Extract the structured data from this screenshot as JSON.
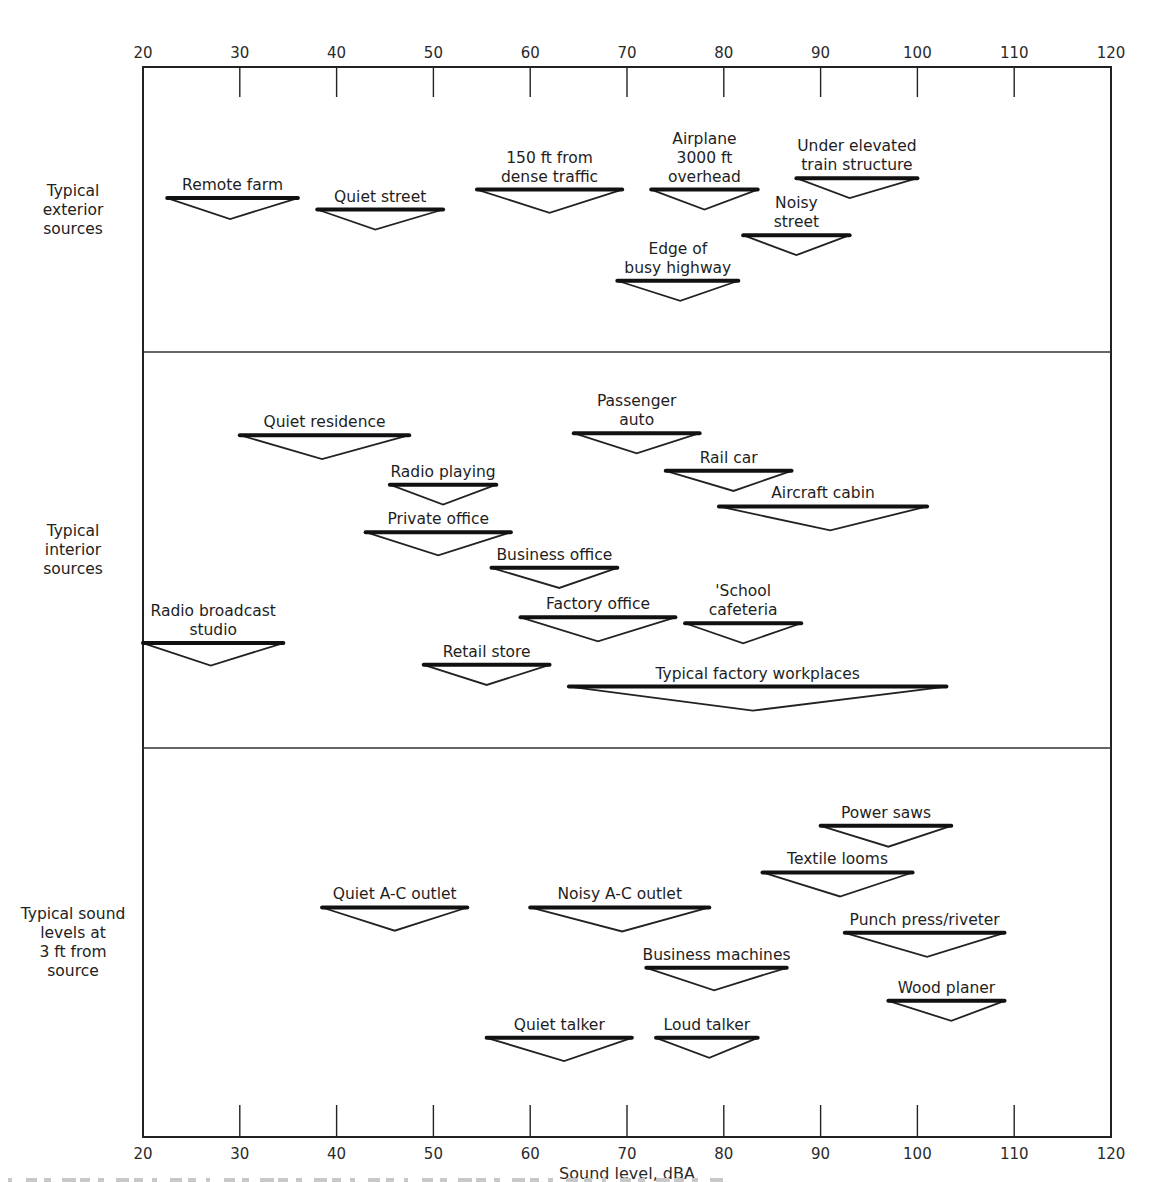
{
  "chart_data": {
    "type": "range-markers",
    "title": "",
    "xlabel": "Sound level, dBA",
    "xlim": [
      20,
      120
    ],
    "xticks": [
      20,
      30,
      40,
      50,
      60,
      70,
      80,
      90,
      100,
      110,
      120
    ],
    "xtick_labels": [
      "20",
      "30",
      "40",
      "50",
      "60",
      "70",
      "80",
      "90",
      "100",
      "110",
      "120"
    ],
    "axis_positions": [
      "top",
      "bottom"
    ],
    "grid": false,
    "marker_description": "Inverted triangle spans low-to-high dBA range; apex marks typical level",
    "panels": [
      {
        "name": "Typical exterior sources",
        "label_lines": [
          "Typical",
          "exterior",
          "sources"
        ],
        "items": [
          {
            "label_lines": [
              "Remote farm"
            ],
            "low": 22.5,
            "high": 36,
            "typical": 29,
            "row": 0.46
          },
          {
            "label_lines": [
              "Quiet  street"
            ],
            "low": 38,
            "high": 51,
            "typical": 44,
            "row": 0.5
          },
          {
            "label_lines": [
              "150 ft from",
              "dense traffic"
            ],
            "low": 54.5,
            "high": 69.5,
            "typical": 62,
            "row": 0.43
          },
          {
            "label_lines": [
              "Airplane",
              "3000 ft",
              "overhead"
            ],
            "low": 72.5,
            "high": 83.5,
            "typical": 78,
            "row": 0.43
          },
          {
            "label_lines": [
              "Under elevated",
              "train structure"
            ],
            "low": 87.5,
            "high": 100,
            "typical": 93,
            "row": 0.39
          },
          {
            "label_lines": [
              "Noisy",
              "street"
            ],
            "low": 82,
            "high": 93,
            "typical": 87.5,
            "row": 0.59
          },
          {
            "label_lines": [
              "Edge of",
              "busy highway"
            ],
            "low": 69,
            "high": 81.5,
            "typical": 75.5,
            "row": 0.75
          }
        ]
      },
      {
        "name": "Typical interior sources",
        "label_lines": [
          "Typical",
          "interior",
          "sources"
        ],
        "items": [
          {
            "label_lines": [
              "Quiet residence"
            ],
            "low": 30,
            "high": 47.5,
            "typical": 38.5,
            "row": 0.21
          },
          {
            "label_lines": [
              "Passenger",
              "auto"
            ],
            "low": 64.5,
            "high": 77.5,
            "typical": 71,
            "row": 0.205
          },
          {
            "label_lines": [
              "Radio playing"
            ],
            "low": 45.5,
            "high": 56.5,
            "typical": 51,
            "row": 0.335
          },
          {
            "label_lines": [
              "Rail car"
            ],
            "low": 74,
            "high": 87,
            "typical": 81,
            "row": 0.3
          },
          {
            "label_lines": [
              "Aircraft cabin"
            ],
            "low": 79.5,
            "high": 101,
            "typical": 91,
            "row": 0.39
          },
          {
            "label_lines": [
              "Private office"
            ],
            "low": 43,
            "high": 58,
            "typical": 50.5,
            "row": 0.455
          },
          {
            "label_lines": [
              "Business office"
            ],
            "low": 56,
            "high": 69,
            "typical": 63,
            "row": 0.545
          },
          {
            "label_lines": [
              "Factory office"
            ],
            "low": 59,
            "high": 75,
            "typical": 67,
            "row": 0.67
          },
          {
            "label_lines": [
              "'School",
              "cafeteria"
            ],
            "low": 76,
            "high": 88,
            "typical": 82,
            "row": 0.685
          },
          {
            "label_lines": [
              "Radio broadcast",
              "studio"
            ],
            "low": 20,
            "high": 34.5,
            "typical": 27,
            "row": 0.735
          },
          {
            "label_lines": [
              "Retail store"
            ],
            "low": 49,
            "high": 62,
            "typical": 55.5,
            "row": 0.79
          },
          {
            "label_lines": [
              "Typical factory workplaces"
            ],
            "low": 64,
            "high": 103,
            "typical": 83,
            "row": 0.845
          }
        ]
      },
      {
        "name": "Typical sound levels at 3 ft from source",
        "label_lines": [
          "Typical sound",
          "levels at",
          "3 ft from",
          "source"
        ],
        "items": [
          {
            "label_lines": [
              "Power saws"
            ],
            "low": 90,
            "high": 103.5,
            "typical": 97,
            "row": 0.2
          },
          {
            "label_lines": [
              "Textile looms"
            ],
            "low": 84,
            "high": 99.5,
            "typical": 92,
            "row": 0.32
          },
          {
            "label_lines": [
              "Quiet A-C outlet"
            ],
            "low": 38.5,
            "high": 53.5,
            "typical": 46,
            "row": 0.41
          },
          {
            "label_lines": [
              "Noisy A-C outlet"
            ],
            "low": 60,
            "high": 78.5,
            "typical": 69.5,
            "row": 0.41
          },
          {
            "label_lines": [
              "Punch press/riveter"
            ],
            "low": 92.5,
            "high": 109,
            "typical": 101,
            "row": 0.475
          },
          {
            "label_lines": [
              "Business machines"
            ],
            "low": 72,
            "high": 86.5,
            "typical": 79,
            "row": 0.565
          },
          {
            "label_lines": [
              "Wood planer"
            ],
            "low": 97,
            "high": 109,
            "typical": 103.5,
            "row": 0.65
          },
          {
            "label_lines": [
              "Quiet talker"
            ],
            "low": 55.5,
            "high": 70.5,
            "typical": 63.5,
            "row": 0.745
          },
          {
            "label_lines": [
              "Loud talker"
            ],
            "low": 73,
            "high": 83.5,
            "typical": 78.5,
            "row": 0.745
          }
        ]
      }
    ]
  }
}
